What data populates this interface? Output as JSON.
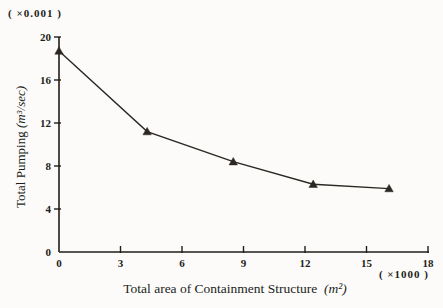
{
  "page": {
    "background": "#fcfbf9",
    "ink_color": "#211e1a",
    "line_color": "#2b2723"
  },
  "labels": {
    "y_multiplier": "( ×0.001 )",
    "x_multiplier": "( ×1000 )",
    "y_title_text": "Total Pumping",
    "y_title_unit": "(m³/sec)",
    "x_title_text": "Total area of Containment Structure",
    "x_title_unit": "(m²)"
  },
  "chart_data": {
    "type": "line",
    "title": "",
    "xlabel": "Total area of Containment Structure (m²)",
    "ylabel": "Total Pumping (m³/sec)",
    "x_multiplier_label": "( ×1000 )",
    "y_multiplier_label": "( ×0.001 )",
    "xlim": [
      0,
      18
    ],
    "ylim": [
      0,
      20
    ],
    "xticks": [
      0,
      3,
      6,
      9,
      12,
      15,
      18
    ],
    "yticks": [
      0,
      4,
      8,
      12,
      16,
      20
    ],
    "grid": false,
    "legend": false,
    "marker": "filled-triangle-up",
    "series": [
      {
        "name": "total-pumping-vs-containment-area",
        "x": [
          0,
          4.3,
          8.5,
          12.4,
          16.1
        ],
        "y": [
          18.7,
          11.2,
          8.4,
          6.3,
          5.9
        ]
      }
    ]
  }
}
